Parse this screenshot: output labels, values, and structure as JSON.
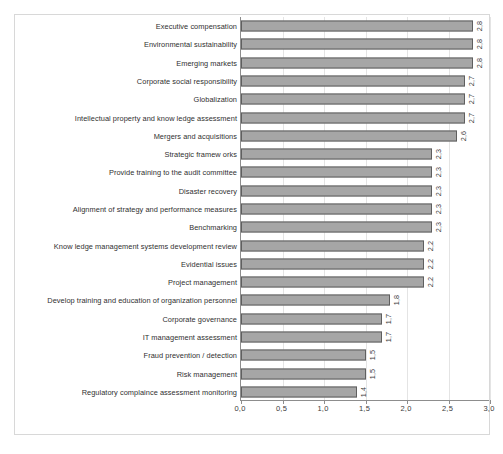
{
  "chart_data": {
    "type": "bar",
    "orientation": "horizontal",
    "title": "",
    "subtitle": "",
    "xlabel": "",
    "ylabel": "",
    "xlim": [
      0.0,
      3.0
    ],
    "xticks": [
      "0,0",
      "0,5",
      "1,0",
      "1,5",
      "2,0",
      "2,5",
      "3,0"
    ],
    "xtick_values": [
      0.0,
      0.5,
      1.0,
      1.5,
      2.0,
      2.5,
      3.0
    ],
    "grid": true,
    "legend": null,
    "decimal_separator": ",",
    "bar_color": "#a6a6a6",
    "bar_edge_color": "#5f5f5f",
    "value_label_rotation": -90,
    "categories": [
      "Executive compensation",
      "Environmental sustainability",
      "Emerging markets",
      "Corporate social responsibility",
      "Globalization",
      "Intellectual property and know ledge assessment",
      "Mergers and acquisitions",
      "Strategic framew orks",
      "Provide training to the audit committee",
      "Disaster recovery",
      "Alignment of strategy and performance measures",
      "Benchmarking",
      "Know ledge management systems development review",
      "Evidential issues",
      "Project management",
      "Develop training and education of organization personnel",
      "Corporate governance",
      "IT management assessment",
      "Fraud prevention / detection",
      "Risk management",
      "Regulatory complaince assessment monitoring"
    ],
    "values": [
      2.8,
      2.8,
      2.8,
      2.7,
      2.7,
      2.7,
      2.6,
      2.3,
      2.3,
      2.3,
      2.3,
      2.3,
      2.2,
      2.2,
      2.2,
      1.8,
      1.7,
      1.7,
      1.5,
      1.5,
      1.4
    ],
    "value_labels": [
      "2,8",
      "2,8",
      "2,8",
      "2,7",
      "2,7",
      "2,7",
      "2,6",
      "2,3",
      "2,3",
      "2,3",
      "2,3",
      "2,3",
      "2,2",
      "2,2",
      "2,2",
      "1,8",
      "1,7",
      "1,7",
      "1,5",
      "1,5",
      "1,4"
    ]
  }
}
